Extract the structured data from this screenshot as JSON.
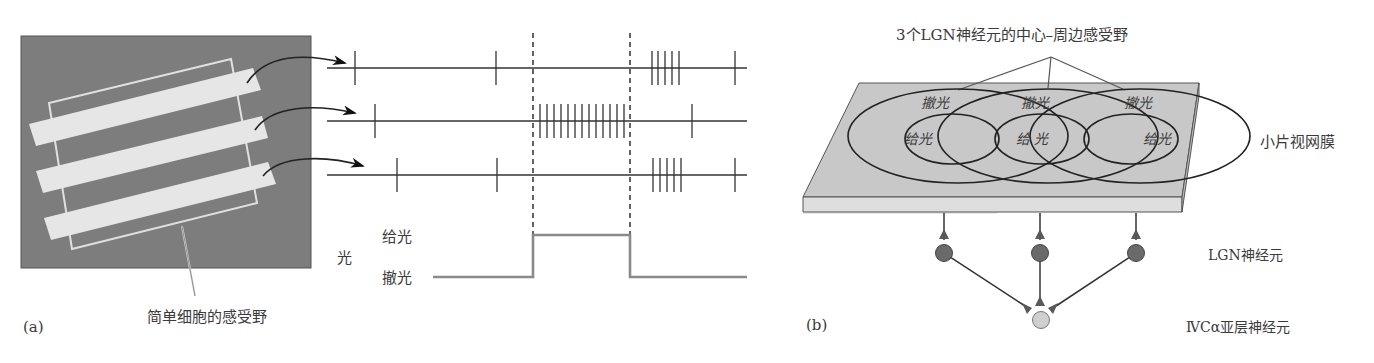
{
  "panel_a": {
    "label": "(a)",
    "receptive_field_caption": "简单细胞的感受野",
    "stimulus_axis_label": "光",
    "stimulus_on_label": "给光",
    "stimulus_off_label": "撤光",
    "spike_trains": [
      {
        "name": "bar-1",
        "spikes_x": [
          355,
          496,
          652,
          658,
          665,
          672,
          679,
          735
        ]
      },
      {
        "name": "bar-2",
        "spikes_x": [
          375,
          540,
          547,
          554,
          561,
          568,
          575,
          582,
          589,
          596,
          603,
          610,
          617,
          624,
          692
        ]
      },
      {
        "name": "bar-3",
        "spikes_x": [
          397,
          497,
          653,
          660,
          667,
          674,
          681,
          735
        ]
      }
    ],
    "stimulus_onset_x": 533,
    "stimulus_offset_x": 630
  },
  "panel_b": {
    "label": "(b)",
    "title": "3个LGN神经元的中心–周边感受野",
    "retina_label": "小片视网膜",
    "lgn_label": "LGN神经元",
    "cortex_label": "ⅣCα亚层神经元",
    "fields": [
      {
        "surround": "撤光",
        "center": "给光"
      },
      {
        "surround": "撤光",
        "center": "给 光"
      },
      {
        "surround": "撤光",
        "center": "给光"
      }
    ]
  },
  "colors": {
    "stimulus_bg": "#7d7d7d",
    "bar_fill": "#e6e6e6",
    "retina_top": "#c8c8c8",
    "lgn_cell": "#6a6a6a",
    "cortex_cell": "#cfcfcf",
    "line": "#333333"
  }
}
